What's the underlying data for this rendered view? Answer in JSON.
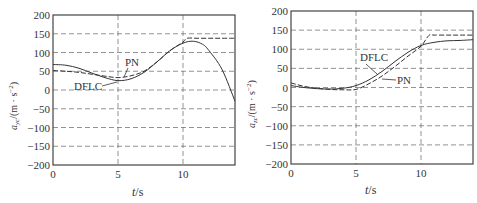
{
  "chart_data": [
    {
      "type": "line",
      "title": "",
      "xlabel": "t/s",
      "ylabel": "a_yc/(m · s^-2)",
      "xlim": [
        0,
        14
      ],
      "ylim": [
        -200,
        200
      ],
      "xticks": [
        0,
        5,
        10
      ],
      "yticks": [
        -200,
        -150,
        -100,
        -50,
        0,
        50,
        100,
        150,
        200
      ],
      "grid": true,
      "grid_style": "dashed",
      "annotations": [
        "PN",
        "DFLC"
      ],
      "series": [
        {
          "name": "PN",
          "style": "dashed",
          "x": [
            0,
            1,
            2,
            3,
            4,
            5,
            6,
            7,
            8,
            9,
            10,
            10.3,
            11,
            12,
            13,
            14
          ],
          "y": [
            52,
            50,
            47,
            42,
            37,
            33,
            38,
            50,
            75,
            105,
            128,
            138,
            138,
            138,
            138,
            138
          ]
        },
        {
          "name": "DFLC",
          "style": "solid",
          "x": [
            0,
            1,
            2,
            3,
            4,
            5,
            6,
            7,
            8,
            9,
            10,
            10.8,
            11.5,
            12,
            13,
            14
          ],
          "y": [
            68,
            66,
            58,
            45,
            33,
            25,
            30,
            47,
            75,
            105,
            125,
            130,
            122,
            105,
            55,
            -30
          ]
        }
      ]
    },
    {
      "type": "line",
      "title": "",
      "xlabel": "t/s",
      "ylabel": "a_zc/(m · s^-2)",
      "xlim": [
        0,
        14
      ],
      "ylim": [
        -200,
        200
      ],
      "xticks": [
        0,
        5,
        10
      ],
      "yticks": [
        -200,
        -150,
        -100,
        -50,
        0,
        50,
        100,
        150,
        200
      ],
      "grid": true,
      "grid_style": "dashed",
      "annotations": [
        "DFLC",
        "PN"
      ],
      "series": [
        {
          "name": "PN",
          "style": "dashed",
          "x": [
            0,
            1,
            2,
            3,
            4,
            5,
            6,
            7,
            8,
            9,
            10,
            10.6,
            11,
            12,
            13,
            14
          ],
          "y": [
            12,
            3,
            -2,
            -5,
            -6,
            -5,
            10,
            30,
            55,
            82,
            108,
            136,
            137,
            137,
            137,
            137
          ]
        },
        {
          "name": "DFLC",
          "style": "solid",
          "x": [
            0,
            1,
            2,
            3,
            4,
            5,
            6,
            7,
            8,
            9,
            10,
            11,
            12,
            13,
            14
          ],
          "y": [
            5,
            0,
            -3,
            -4,
            -2,
            5,
            20,
            42,
            68,
            92,
            110,
            118,
            122,
            123,
            125
          ]
        }
      ]
    }
  ],
  "left_chart": {
    "ylabel_main": "a",
    "ylabel_sub": "yc",
    "ylabel_units": "/(m · s",
    "ylabel_exp": "−2",
    "ylabel_close": ")",
    "xlabel_t": "t",
    "xlabel_rest": "/s",
    "y_tick_labels": [
      "200",
      "150",
      "100",
      "50",
      "0",
      "−50",
      "−100",
      "−150",
      "−200"
    ],
    "x_tick_labels": [
      "0",
      "5",
      "10"
    ],
    "annot_pn": "PN",
    "annot_dflc": "DFLC"
  },
  "right_chart": {
    "ylabel_main": "a",
    "ylabel_sub": "zc",
    "ylabel_units": "/(m · s",
    "ylabel_exp": "−2",
    "ylabel_close": ")",
    "xlabel_t": "t",
    "xlabel_rest": "/s",
    "y_tick_labels": [
      "200",
      "150",
      "100",
      "50",
      "0",
      "−50",
      "−100",
      "−150",
      "−200"
    ],
    "x_tick_labels": [
      "0",
      "5",
      "10"
    ],
    "annot_pn": "PN",
    "annot_dflc": "DFLC"
  },
  "colors": {
    "axis": "#444444",
    "grid": "#666666",
    "line": "#333333"
  }
}
